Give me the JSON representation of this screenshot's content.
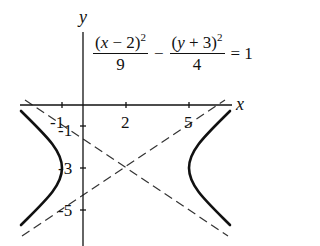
{
  "figure": {
    "type": "hyperbola-graph",
    "axes": {
      "x_label": "x",
      "y_label": "y",
      "x_ticks": [
        {
          "value": -1,
          "label": "-1"
        },
        {
          "value": 2,
          "label": "2"
        },
        {
          "value": 5,
          "label": "5"
        }
      ],
      "y_ticks": [
        {
          "value": -1,
          "label": "-1"
        },
        {
          "value": -3,
          "label": "-3"
        },
        {
          "value": -5,
          "label": "-5"
        }
      ]
    },
    "equation": {
      "text": "(x − 2)^2/9 − (y + 3)^2/4 = 1",
      "term1_numerator_open": "(",
      "term1_var": "x",
      "term1_rest": " − 2)",
      "term1_exp": "2",
      "term1_denominator": "9",
      "minus": "−",
      "term2_numerator_open": "(",
      "term2_var": "y",
      "term2_rest": " + 3)",
      "term2_exp": "2",
      "term2_denominator": "4",
      "equals": "= 1"
    },
    "hyperbola": {
      "center": [
        2,
        -3
      ],
      "a": 3,
      "b": 2,
      "vertices": [
        [
          -1,
          -3
        ],
        [
          5,
          -3
        ]
      ],
      "orientation": "horizontal",
      "stroke": "#111111"
    },
    "asymptotes": {
      "lines": [
        "y + 3 = (2/3)(x − 2)",
        "y + 3 = −(2/3)(x − 2)"
      ],
      "style": "dashed",
      "stroke": "#333333"
    }
  }
}
